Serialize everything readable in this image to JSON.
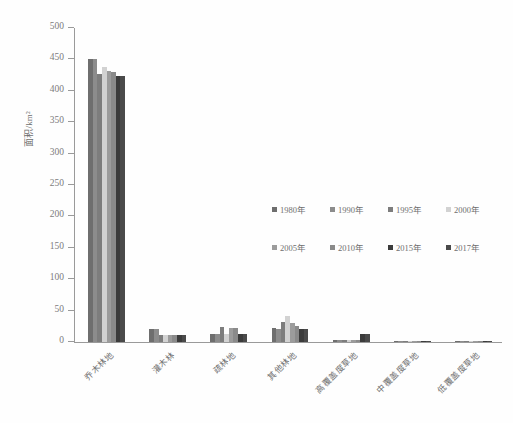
{
  "chart_data": {
    "type": "bar",
    "title": "",
    "subtitle": "",
    "xlabel": "",
    "ylabel": "面积/km²",
    "ylim": [
      0,
      500
    ],
    "yticks": [
      0,
      50,
      100,
      150,
      200,
      250,
      300,
      350,
      400,
      450,
      500
    ],
    "ytick_labels": [
      "0",
      "50",
      "100",
      "150",
      "200",
      "250",
      "300",
      "350",
      "400",
      "450",
      "500"
    ],
    "grid": false,
    "legend_position": "inside-center-right",
    "categories": [
      "乔木林地",
      "灌木林",
      "疏林地",
      "其他林地",
      "高覆盖度草地",
      "中覆盖度草地",
      "低覆盖度草地"
    ],
    "series": [
      {
        "name": "1980年",
        "color": "#6e6e6e",
        "values": [
          451,
          21,
          12,
          22,
          2.5,
          1.2,
          0.6
        ]
      },
      {
        "name": "1990年",
        "color": "#8c8c8c",
        "values": [
          450,
          20,
          12,
          21,
          2.5,
          1.2,
          0.6
        ]
      },
      {
        "name": "1995年",
        "color": "#7d7d7d",
        "values": [
          426,
          11,
          24,
          32,
          2.5,
          1.2,
          0.6
        ]
      },
      {
        "name": "2000年",
        "color": "#d2d2d2",
        "values": [
          438,
          11,
          13,
          42,
          2.5,
          1.0,
          0.5
        ]
      },
      {
        "name": "2005年",
        "color": "#9c9c9c",
        "values": [
          432,
          11,
          22,
          31,
          2.5,
          1.0,
          0.5
        ]
      },
      {
        "name": "2010年",
        "color": "#8a8a8a",
        "values": [
          430,
          11,
          23,
          26,
          2.5,
          1.0,
          0.5
        ]
      },
      {
        "name": "2015年",
        "color": "#3b3b3b",
        "values": [
          423,
          11,
          13,
          21,
          12,
          1.0,
          0.5
        ]
      },
      {
        "name": "2017年",
        "color": "#4a4a4a",
        "values": [
          423,
          11,
          13,
          21,
          12,
          1.0,
          0.5
        ]
      }
    ]
  },
  "legend": {
    "rows": [
      [
        "1980年",
        "1990年",
        "1995年",
        "2000年"
      ],
      [
        "2005年",
        "2010年",
        "2015年",
        "2017年"
      ]
    ]
  }
}
